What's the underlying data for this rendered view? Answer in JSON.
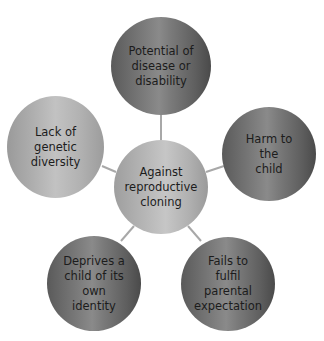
{
  "diagram": {
    "type": "hub-and-spoke",
    "center": {
      "label": "Against reproductive cloning",
      "lines": [
        "Against",
        "reproductive",
        "cloning"
      ]
    },
    "nodes": [
      {
        "id": "top",
        "label": "Potential of disease or disability",
        "lines": [
          "Potential of",
          "disease or",
          "disability"
        ],
        "shade": "dark"
      },
      {
        "id": "right",
        "label": "Harm to the child",
        "lines": [
          "Harm to the",
          "child"
        ],
        "shade": "dark"
      },
      {
        "id": "bottom-right",
        "label": "Fails to fulfil parental expectation",
        "lines": [
          "Fails to fulfil",
          "parental",
          "expectation"
        ],
        "shade": "dark"
      },
      {
        "id": "bottom-left",
        "label": "Deprives a child of its own identity",
        "lines": [
          "Deprives a",
          "child of its",
          "own identity"
        ],
        "shade": "dark"
      },
      {
        "id": "left",
        "label": "Lack of genetic diversity",
        "lines": [
          "Lack of",
          "genetic",
          "diversity"
        ],
        "shade": "light"
      }
    ],
    "colors": {
      "background": "#ffffff",
      "dark_node": "#6e6e6e",
      "light_node": "#b0b0b0",
      "center_node": "#b8b8b8",
      "connector": "#a8a8a8",
      "text": "#1c1c1c"
    }
  }
}
